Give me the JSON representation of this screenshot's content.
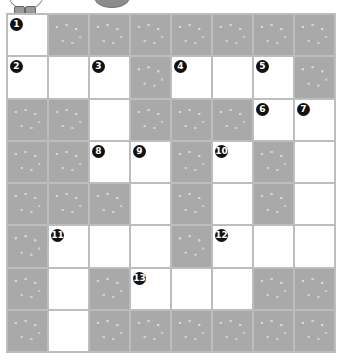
{
  "puzzle": {
    "type": "crossword",
    "rows": 8,
    "cols": 8,
    "legend": {
      "#": "block",
      ".": "open"
    },
    "layout": [
      ".#######",
      "...#...#",
      "##.###..",
      "##..#.#.",
      "###.#.#.",
      "#...#...",
      "#.#...##",
      "#.######"
    ],
    "clue_numbers": [
      {
        "n": "1",
        "row": 0,
        "col": 0
      },
      {
        "n": "2",
        "row": 1,
        "col": 0
      },
      {
        "n": "3",
        "row": 1,
        "col": 2
      },
      {
        "n": "4",
        "row": 1,
        "col": 4
      },
      {
        "n": "5",
        "row": 1,
        "col": 6
      },
      {
        "n": "6",
        "row": 2,
        "col": 6
      },
      {
        "n": "7",
        "row": 2,
        "col": 7
      },
      {
        "n": "8",
        "row": 3,
        "col": 2
      },
      {
        "n": "9",
        "row": 3,
        "col": 3
      },
      {
        "n": "10",
        "row": 3,
        "col": 5
      },
      {
        "n": "11",
        "row": 5,
        "col": 1
      },
      {
        "n": "12",
        "row": 5,
        "col": 5
      },
      {
        "n": "13",
        "row": 6,
        "col": 3
      }
    ],
    "colors": {
      "block": "#a9a9a9",
      "open": "#ffffff",
      "grid_line": "#bdbdbd",
      "number_badge": "#111111"
    }
  },
  "decor": {
    "mascot_icon": "cartoon-character-feet",
    "oval_icon": "gray-oval"
  }
}
